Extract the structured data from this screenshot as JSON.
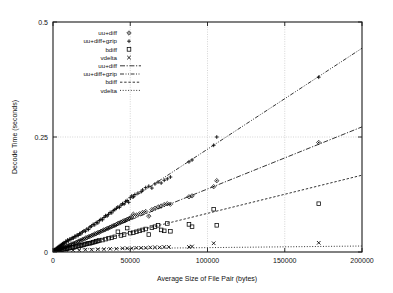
{
  "figure": {
    "background": "#ffffff",
    "foreground": "#000000",
    "grid_color": "#b9b9b9"
  },
  "chart_data": {
    "type": "scatter",
    "title": "",
    "xlabel": "Average Size of File Pair (bytes)",
    "ylabel": "Decode Time (seconds)",
    "xlim": [
      0,
      200000
    ],
    "ylim": [
      0,
      0.5
    ],
    "xticks": [
      0,
      50000,
      100000,
      150000,
      200000
    ],
    "xticklabels": [
      "0",
      "50000",
      "100000",
      "150000",
      "200000"
    ],
    "yticks": [
      0,
      0.25,
      0.5
    ],
    "yticklabels": [
      "0",
      "0.25",
      "0.5"
    ],
    "grid": true,
    "grid_axes": "both",
    "legend_position": "upper-left-inside",
    "legend_entries": [
      {
        "label": "uu+diff",
        "kind": "marker",
        "marker": "diamond-dot",
        "color": "#000000"
      },
      {
        "label": "uu+diff+gzip",
        "kind": "marker",
        "marker": "plus",
        "color": "#000000"
      },
      {
        "label": "bdiff",
        "kind": "marker",
        "marker": "open-square",
        "color": "#000000"
      },
      {
        "label": "vdelta",
        "kind": "marker",
        "marker": "cross",
        "color": "#000000"
      },
      {
        "label": "uu+diff",
        "kind": "line",
        "dash": "dash-dot",
        "color": "#000000"
      },
      {
        "label": "uu+diff+gzip",
        "kind": "line",
        "dash": "dash-dot-dot",
        "color": "#000000"
      },
      {
        "label": "bdiff",
        "kind": "line",
        "dash": "fine-dash",
        "color": "#000000"
      },
      {
        "label": "vdelta",
        "kind": "line",
        "dash": "dotted",
        "color": "#000000"
      }
    ],
    "fit_lines": [
      {
        "name": "uu+diff+gzip",
        "dash": "dash-dot-dot",
        "x0": 0,
        "y0": 0.004,
        "x1": 200000,
        "y1": 0.443
      },
      {
        "name": "uu+diff",
        "dash": "dash-dot",
        "x0": 0,
        "y0": 0.002,
        "x1": 200000,
        "y1": 0.272
      },
      {
        "name": "bdiff",
        "dash": "fine-dash",
        "x0": 0,
        "y0": 0.001,
        "x1": 200000,
        "y1": 0.167
      },
      {
        "name": "vdelta",
        "dash": "dotted",
        "x0": 0,
        "y0": 0.006,
        "x1": 200000,
        "y1": 0.013
      }
    ],
    "series": [
      {
        "name": "uu+diff+gzip",
        "marker": "plus",
        "points": [
          [
            900,
            0.004
          ],
          [
            1400,
            0.006
          ],
          [
            1800,
            0.005
          ],
          [
            2200,
            0.008
          ],
          [
            2600,
            0.007
          ],
          [
            3000,
            0.01
          ],
          [
            3400,
            0.009
          ],
          [
            3800,
            0.012
          ],
          [
            4200,
            0.011
          ],
          [
            4600,
            0.014
          ],
          [
            5000,
            0.013
          ],
          [
            5400,
            0.016
          ],
          [
            5800,
            0.015
          ],
          [
            6200,
            0.018
          ],
          [
            6600,
            0.017
          ],
          [
            7000,
            0.02
          ],
          [
            7600,
            0.019
          ],
          [
            8200,
            0.023
          ],
          [
            8800,
            0.022
          ],
          [
            9400,
            0.026
          ],
          [
            10000,
            0.024
          ],
          [
            10800,
            0.028
          ],
          [
            11600,
            0.027
          ],
          [
            12400,
            0.031
          ],
          [
            13200,
            0.03
          ],
          [
            14000,
            0.034
          ],
          [
            14800,
            0.033
          ],
          [
            15600,
            0.037
          ],
          [
            16400,
            0.036
          ],
          [
            17200,
            0.04
          ],
          [
            18000,
            0.039
          ],
          [
            19000,
            0.043
          ],
          [
            20000,
            0.046
          ],
          [
            21000,
            0.045
          ],
          [
            22000,
            0.05
          ],
          [
            23000,
            0.049
          ],
          [
            24000,
            0.054
          ],
          [
            25000,
            0.056
          ],
          [
            26000,
            0.06
          ],
          [
            27000,
            0.059
          ],
          [
            28000,
            0.064
          ],
          [
            29000,
            0.063
          ],
          [
            30000,
            0.068
          ],
          [
            31000,
            0.071
          ],
          [
            32000,
            0.07
          ],
          [
            33000,
            0.075
          ],
          [
            34000,
            0.079
          ],
          [
            35000,
            0.078
          ],
          [
            36000,
            0.082
          ],
          [
            37000,
            0.086
          ],
          [
            38000,
            0.085
          ],
          [
            39000,
            0.09
          ],
          [
            40000,
            0.092
          ],
          [
            41000,
            0.095
          ],
          [
            42000,
            0.098
          ],
          [
            43000,
            0.097
          ],
          [
            44000,
            0.102
          ],
          [
            45000,
            0.105
          ],
          [
            46000,
            0.104
          ],
          [
            47000,
            0.11
          ],
          [
            48000,
            0.112
          ],
          [
            49000,
            0.108
          ],
          [
            50000,
            0.118
          ],
          [
            51000,
            0.122
          ],
          [
            52000,
            0.12
          ],
          [
            53000,
            0.125
          ],
          [
            55000,
            0.128
          ],
          [
            57000,
            0.131
          ],
          [
            58000,
            0.135
          ],
          [
            60000,
            0.14
          ],
          [
            62000,
            0.143
          ],
          [
            64000,
            0.139
          ],
          [
            66000,
            0.148
          ],
          [
            68000,
            0.152
          ],
          [
            70000,
            0.15
          ],
          [
            72000,
            0.156
          ],
          [
            74000,
            0.159
          ],
          [
            76000,
            0.163
          ],
          [
            88000,
            0.196
          ],
          [
            90000,
            0.2
          ],
          [
            104000,
            0.232
          ],
          [
            106000,
            0.25
          ],
          [
            172000,
            0.38
          ]
        ]
      },
      {
        "name": "uu+diff",
        "marker": "diamond-dot",
        "points": [
          [
            900,
            0.002
          ],
          [
            1500,
            0.003
          ],
          [
            2100,
            0.004
          ],
          [
            2700,
            0.005
          ],
          [
            3300,
            0.005
          ],
          [
            3900,
            0.006
          ],
          [
            4500,
            0.007
          ],
          [
            5100,
            0.008
          ],
          [
            5700,
            0.008
          ],
          [
            6300,
            0.009
          ],
          [
            7000,
            0.01
          ],
          [
            7800,
            0.011
          ],
          [
            8600,
            0.012
          ],
          [
            9400,
            0.013
          ],
          [
            10200,
            0.014
          ],
          [
            11000,
            0.015
          ],
          [
            12000,
            0.017
          ],
          [
            13000,
            0.018
          ],
          [
            14000,
            0.019
          ],
          [
            15000,
            0.021
          ],
          [
            16000,
            0.022
          ],
          [
            17000,
            0.024
          ],
          [
            18000,
            0.025
          ],
          [
            19000,
            0.027
          ],
          [
            20000,
            0.028
          ],
          [
            21000,
            0.03
          ],
          [
            22000,
            0.031
          ],
          [
            23000,
            0.033
          ],
          [
            24000,
            0.034
          ],
          [
            25000,
            0.036
          ],
          [
            26000,
            0.037
          ],
          [
            27000,
            0.039
          ],
          [
            28000,
            0.04
          ],
          [
            29000,
            0.042
          ],
          [
            30000,
            0.043
          ],
          [
            31000,
            0.045
          ],
          [
            32000,
            0.046
          ],
          [
            33000,
            0.048
          ],
          [
            34000,
            0.049
          ],
          [
            35000,
            0.051
          ],
          [
            36000,
            0.052
          ],
          [
            37000,
            0.054
          ],
          [
            38000,
            0.055
          ],
          [
            39000,
            0.057
          ],
          [
            40000,
            0.058
          ],
          [
            41000,
            0.06
          ],
          [
            42000,
            0.062
          ],
          [
            43000,
            0.063
          ],
          [
            44000,
            0.065
          ],
          [
            45000,
            0.066
          ],
          [
            46000,
            0.068
          ],
          [
            47000,
            0.069
          ],
          [
            48000,
            0.071
          ],
          [
            49000,
            0.072
          ],
          [
            50000,
            0.074
          ],
          [
            51000,
            0.076
          ],
          [
            52000,
            0.082
          ],
          [
            54000,
            0.08
          ],
          [
            56000,
            0.083
          ],
          [
            58000,
            0.086
          ],
          [
            60000,
            0.088
          ],
          [
            62000,
            0.078
          ],
          [
            64000,
            0.092
          ],
          [
            66000,
            0.095
          ],
          [
            68000,
            0.098
          ],
          [
            70000,
            0.1
          ],
          [
            72000,
            0.103
          ],
          [
            74000,
            0.105
          ],
          [
            76000,
            0.104
          ],
          [
            88000,
            0.12
          ],
          [
            90000,
            0.122
          ],
          [
            104000,
            0.142
          ],
          [
            106000,
            0.155
          ],
          [
            172000,
            0.238
          ]
        ]
      },
      {
        "name": "bdiff",
        "marker": "open-square",
        "points": [
          [
            1200,
            0.002
          ],
          [
            2000,
            0.003
          ],
          [
            2800,
            0.003
          ],
          [
            3600,
            0.004
          ],
          [
            4400,
            0.004
          ],
          [
            5200,
            0.005
          ],
          [
            6000,
            0.005
          ],
          [
            7000,
            0.006
          ],
          [
            8000,
            0.007
          ],
          [
            9000,
            0.007
          ],
          [
            10000,
            0.008
          ],
          [
            11000,
            0.009
          ],
          [
            12000,
            0.01
          ],
          [
            13000,
            0.01
          ],
          [
            14000,
            0.011
          ],
          [
            15000,
            0.012
          ],
          [
            16000,
            0.013
          ],
          [
            17000,
            0.014
          ],
          [
            18000,
            0.014
          ],
          [
            19000,
            0.015
          ],
          [
            20000,
            0.016
          ],
          [
            21000,
            0.017
          ],
          [
            22000,
            0.018
          ],
          [
            23000,
            0.019
          ],
          [
            24000,
            0.019
          ],
          [
            25000,
            0.02
          ],
          [
            26000,
            0.021
          ],
          [
            27000,
            0.022
          ],
          [
            28000,
            0.023
          ],
          [
            29000,
            0.024
          ],
          [
            30000,
            0.025
          ],
          [
            32000,
            0.026
          ],
          [
            34000,
            0.028
          ],
          [
            36000,
            0.03
          ],
          [
            38000,
            0.031
          ],
          [
            40000,
            0.033
          ],
          [
            42000,
            0.044
          ],
          [
            44000,
            0.036
          ],
          [
            46000,
            0.038
          ],
          [
            48000,
            0.052
          ],
          [
            50000,
            0.041
          ],
          [
            52000,
            0.042
          ],
          [
            54000,
            0.044
          ],
          [
            56000,
            0.046
          ],
          [
            58000,
            0.048
          ],
          [
            60000,
            0.05
          ],
          [
            62000,
            0.038
          ],
          [
            64000,
            0.053
          ],
          [
            66000,
            0.055
          ],
          [
            68000,
            0.058
          ],
          [
            70000,
            0.048
          ],
          [
            72000,
            0.046
          ],
          [
            74000,
            0.062
          ],
          [
            76000,
            0.045
          ],
          [
            88000,
            0.06
          ],
          [
            90000,
            0.055
          ],
          [
            104000,
            0.093
          ],
          [
            106000,
            0.058
          ],
          [
            172000,
            0.105
          ]
        ]
      },
      {
        "name": "vdelta",
        "marker": "cross",
        "points": [
          [
            2000,
            0.002
          ],
          [
            5000,
            0.003
          ],
          [
            9000,
            0.003
          ],
          [
            13000,
            0.004
          ],
          [
            17000,
            0.004
          ],
          [
            21000,
            0.005
          ],
          [
            25000,
            0.005
          ],
          [
            29000,
            0.006
          ],
          [
            33000,
            0.006
          ],
          [
            37000,
            0.007
          ],
          [
            41000,
            0.007
          ],
          [
            45000,
            0.008
          ],
          [
            48000,
            0.008
          ],
          [
            51000,
            0.008
          ],
          [
            54000,
            0.009
          ],
          [
            57000,
            0.009
          ],
          [
            60000,
            0.009
          ],
          [
            63000,
            0.01
          ],
          [
            66000,
            0.01
          ],
          [
            69000,
            0.01
          ],
          [
            72000,
            0.011
          ],
          [
            75000,
            0.011
          ],
          [
            88000,
            0.011
          ],
          [
            90000,
            0.012
          ],
          [
            104000,
            0.019
          ],
          [
            172000,
            0.02
          ]
        ]
      }
    ]
  }
}
